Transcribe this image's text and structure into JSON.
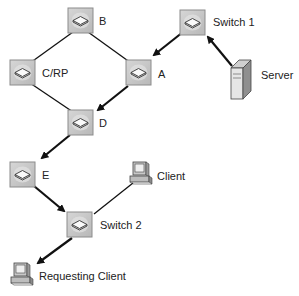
{
  "diagram": {
    "type": "network-topology",
    "nodes": [
      {
        "id": "B",
        "label": "B",
        "kind": "router"
      },
      {
        "id": "switch1",
        "label": "Switch 1",
        "kind": "switch"
      },
      {
        "id": "CRP",
        "label": "C/RP",
        "kind": "router"
      },
      {
        "id": "A",
        "label": "A",
        "kind": "router"
      },
      {
        "id": "server",
        "label": "Server",
        "kind": "server"
      },
      {
        "id": "D",
        "label": "D",
        "kind": "router"
      },
      {
        "id": "E",
        "label": "E",
        "kind": "router"
      },
      {
        "id": "client",
        "label": "Client",
        "kind": "workstation"
      },
      {
        "id": "switch2",
        "label": "Switch 2",
        "kind": "switch"
      },
      {
        "id": "requesting_client",
        "label": "Requesting Client",
        "kind": "workstation"
      }
    ],
    "links": [
      {
        "from": "B",
        "to": "CRP",
        "directed": false
      },
      {
        "from": "B",
        "to": "A",
        "directed": false
      },
      {
        "from": "CRP",
        "to": "D",
        "directed": false
      },
      {
        "from": "A",
        "to": "D",
        "directed": true
      },
      {
        "from": "switch1",
        "to": "A",
        "directed": true
      },
      {
        "from": "server",
        "to": "switch1",
        "directed": true
      },
      {
        "from": "D",
        "to": "E",
        "directed": true
      },
      {
        "from": "E",
        "to": "switch2",
        "directed": true
      },
      {
        "from": "client",
        "to": "switch2",
        "directed": false
      },
      {
        "from": "switch2",
        "to": "requesting_client",
        "directed": true
      }
    ]
  },
  "colors": {
    "line": "#111111",
    "device_fill": "#c8c8c8",
    "device_border": "#8a8a8a"
  }
}
